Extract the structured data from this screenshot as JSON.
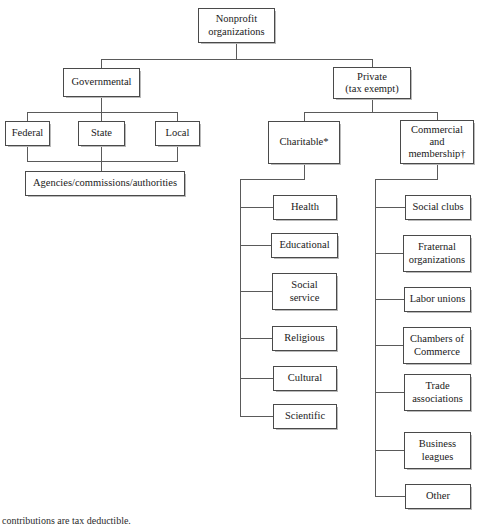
{
  "diagram": {
    "type": "organizational-tree",
    "root": {
      "label": "Nonprofit\norganizations"
    },
    "level1": [
      {
        "label": "Governmental"
      },
      {
        "label": "Private\n(tax exempt)"
      }
    ],
    "governmental_children": [
      {
        "label": "Federal"
      },
      {
        "label": "State"
      },
      {
        "label": "Local"
      }
    ],
    "governmental_leaf": {
      "label": "Agencies/commissions/authorities"
    },
    "private_children": [
      {
        "label": "Charitable*"
      },
      {
        "label": "Commercial\nand\nmembership†"
      }
    ],
    "charitable_children": [
      {
        "label": "Health"
      },
      {
        "label": "Educational"
      },
      {
        "label": "Social\nservice"
      },
      {
        "label": "Religious"
      },
      {
        "label": "Cultural"
      },
      {
        "label": "Scientific"
      }
    ],
    "commercial_children": [
      {
        "label": "Social clubs"
      },
      {
        "label": "Fraternal\norganizations"
      },
      {
        "label": "Labor unions"
      },
      {
        "label": "Chambers of\nCommerce"
      },
      {
        "label": "Trade\nassociations"
      },
      {
        "label": "Business\nleagues"
      },
      {
        "label": "Other"
      }
    ],
    "footnote": "contributions are tax deductible.",
    "colors": {
      "box_border": "#4a4a4a",
      "line": "#5a5a5a",
      "text": "#1a1a1a",
      "background": "#ffffff"
    }
  }
}
